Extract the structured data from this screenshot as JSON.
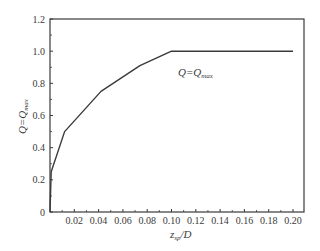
{
  "chart_data": {
    "type": "line",
    "title": "",
    "xlabel": "z_sp/D",
    "xlabel_main": "z",
    "xlabel_sub": "sp",
    "xlabel_tail": "/D",
    "ylabel": "Q=Q_max",
    "ylabel_main": "Q=Q",
    "ylabel_sub": "max",
    "xlim": [
      0,
      0.21
    ],
    "ylim": [
      0,
      1.2
    ],
    "grid": false,
    "legend": null,
    "x_ticks": [
      0.02,
      0.04,
      0.06,
      0.08,
      0.1,
      0.12,
      0.14,
      0.16,
      0.18,
      0.2
    ],
    "x_tick_labels": [
      "0.02",
      "0.04",
      "0.06",
      "0.08",
      "0.10",
      "0.12",
      "0.14",
      "0.16",
      "0.18",
      "0.20"
    ],
    "y_ticks": [
      0,
      0.2,
      0.4,
      0.6,
      0.8,
      1.0,
      1.2
    ],
    "y_tick_labels": [
      "0",
      "0.2",
      "0.4",
      "0.6",
      "0.8",
      "1.0",
      "1.2"
    ],
    "series": [
      {
        "name": "Q/Qmax",
        "x": [
          0,
          0.001,
          0.012,
          0.042,
          0.074,
          0.1,
          0.2
        ],
        "y": [
          0,
          0.25,
          0.5,
          0.75,
          0.91,
          1.0,
          1.0
        ]
      }
    ],
    "annotations": [
      {
        "text": "Q=Q_max",
        "main": "Q=Q",
        "sub": "max",
        "x": 0.13,
        "y": 0.86
      }
    ]
  },
  "style": {
    "line_color": "#3a3a3a",
    "axis_color": "#3a3a3a",
    "background": "#ffffff"
  }
}
